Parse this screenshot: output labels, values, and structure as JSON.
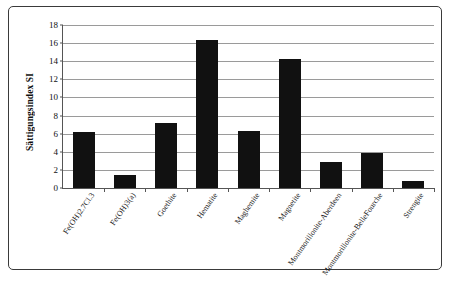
{
  "chart_data": {
    "type": "bar",
    "title": "",
    "xlabel": "",
    "ylabel": "Sättigungsindex SI",
    "ylim": [
      0,
      18
    ],
    "yticks": [
      0,
      2,
      4,
      6,
      8,
      10,
      12,
      14,
      16,
      18
    ],
    "grid": true,
    "legend": null,
    "bar_color": "#111111",
    "categories": [
      "Fe(OH)2.7Cl.3",
      "Fe(OH)3(a)",
      "Goethite",
      "Hematite",
      "Maghemite",
      "Magnetite",
      "Montmorillonite-Aberdeen",
      "Montmorillonite-BelleFourche",
      "Strengite"
    ],
    "values": [
      6.2,
      1.45,
      7.2,
      16.4,
      6.3,
      14.2,
      2.9,
      3.9,
      0.8
    ]
  }
}
